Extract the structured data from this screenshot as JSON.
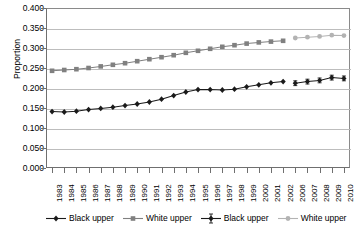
{
  "chart_data": {
    "type": "line",
    "title": "",
    "xlabel": "",
    "ylabel": "Proportion",
    "ylim": [
      0.0,
      0.4
    ],
    "ytick_labels": [
      "0.000",
      "0.050",
      "0.100",
      "0.150",
      "0.200",
      "0.250",
      "0.300",
      "0.350",
      "0.400"
    ],
    "ytick_values": [
      0.0,
      0.05,
      0.1,
      0.15,
      0.2,
      0.25,
      0.3,
      0.35,
      0.4
    ],
    "grid": "horizontal",
    "legend_position": "bottom",
    "categories": [
      "1983",
      "1984",
      "1985",
      "1986",
      "1987",
      "1988",
      "1989",
      "1990",
      "1991",
      "1992",
      "1993",
      "1994",
      "1995",
      "1996",
      "1997",
      "1998",
      "1999",
      "2000",
      "2001",
      "2002",
      "2006",
      "2007",
      "2008",
      "2009",
      "2010"
    ],
    "series": [
      {
        "name": "Black upper",
        "marker": "diamond",
        "color": "#1a1a1a",
        "error_bars": false,
        "x": [
          "1983",
          "1984",
          "1985",
          "1986",
          "1987",
          "1988",
          "1989",
          "1990",
          "1991",
          "1992",
          "1993",
          "1994",
          "1995",
          "1996",
          "1997",
          "1998",
          "1999",
          "2000",
          "2001",
          "2002"
        ],
        "values": [
          0.141,
          0.14,
          0.142,
          0.146,
          0.149,
          0.152,
          0.156,
          0.16,
          0.165,
          0.172,
          0.181,
          0.19,
          0.196,
          0.196,
          0.195,
          0.197,
          0.203,
          0.208,
          0.213,
          0.216
        ]
      },
      {
        "name": "White upper",
        "marker": "square",
        "color": "#808080",
        "error_bars": false,
        "x": [
          "1983",
          "1984",
          "1985",
          "1986",
          "1987",
          "1988",
          "1989",
          "1990",
          "1991",
          "1992",
          "1993",
          "1994",
          "1995",
          "1996",
          "1997",
          "1998",
          "1999",
          "2000",
          "2001",
          "2002"
        ],
        "values": [
          0.243,
          0.245,
          0.247,
          0.25,
          0.254,
          0.258,
          0.262,
          0.267,
          0.272,
          0.277,
          0.282,
          0.288,
          0.293,
          0.298,
          0.303,
          0.307,
          0.311,
          0.314,
          0.316,
          0.318
        ]
      },
      {
        "name": "Black upper",
        "marker": "diamond",
        "color": "#1a1a1a",
        "error_bars": true,
        "x": [
          "2006",
          "2007",
          "2008",
          "2009",
          "2010"
        ],
        "values": [
          0.212,
          0.216,
          0.219,
          0.226,
          0.224
        ],
        "err": [
          0.006,
          0.006,
          0.006,
          0.006,
          0.006
        ]
      },
      {
        "name": "White upper",
        "marker": "circle",
        "color": "#b3b3b3",
        "error_bars": false,
        "x": [
          "2006",
          "2007",
          "2008",
          "2009",
          "2010"
        ],
        "values": [
          0.325,
          0.327,
          0.329,
          0.332,
          0.331
        ]
      }
    ]
  },
  "legend": {
    "items": [
      {
        "label": "Black upper",
        "marker": "diamond",
        "color": "#1a1a1a",
        "err": false
      },
      {
        "label": "White upper",
        "marker": "square",
        "color": "#808080",
        "err": false
      },
      {
        "label": "Black upper",
        "marker": "diamond",
        "color": "#1a1a1a",
        "err": true
      },
      {
        "label": "White upper",
        "marker": "circle",
        "color": "#b3b3b3",
        "err": false
      }
    ]
  }
}
